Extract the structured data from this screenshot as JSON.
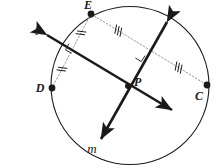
{
  "figure": {
    "background_color": "#ffffff",
    "stroke_color": "#1a1a1a",
    "dotted_color": "#8a8a8a",
    "width": 217,
    "height": 168
  },
  "circle": {
    "name": "circle",
    "cx": 130,
    "cy": 85.5,
    "r": 79,
    "stroke_width": 1.1
  },
  "points": [
    {
      "id": "E",
      "label": "E",
      "x": 91,
      "y": 14,
      "label_x": 88,
      "label_y": 9,
      "dot_r": 3.4
    },
    {
      "id": "D",
      "label": "D",
      "x": 52,
      "y": 88,
      "label_x": 40,
      "label_y": 92,
      "dot_r": 3.4
    },
    {
      "id": "C",
      "label": "C",
      "x": 207,
      "y": 85,
      "label_x": 199,
      "label_y": 100,
      "dot_r": 3.4
    },
    {
      "id": "P",
      "label": "P",
      "x": 128,
      "y": 86,
      "label_x": 134,
      "label_y": 86,
      "dot_r": 3.0
    }
  ],
  "lines": [
    {
      "id": "ell",
      "label": "ℓ",
      "label_x": 37,
      "label_y": 35,
      "x1": 47,
      "y1": 35,
      "x2": 172,
      "y2": 110,
      "stroke_width": 2.6,
      "arrow_start": true,
      "arrow_end": true
    },
    {
      "id": "m",
      "label": "m",
      "label_x": 92,
      "label_y": 153,
      "x1": 167,
      "y1": 22,
      "x2": 101,
      "y2": 139,
      "stroke_width": 2.6,
      "arrow_start": true,
      "arrow_end": true
    }
  ],
  "chords": [
    {
      "id": "chord-EC",
      "from": "E",
      "to": "C",
      "x1": 91,
      "y1": 14,
      "x2": 207,
      "y2": 85,
      "style": "dotted",
      "tick_count": 3,
      "ticks": [
        {
          "t": 0.235,
          "count": 3
        },
        {
          "t": 0.755,
          "count": 3
        }
      ],
      "right_angle_at": {
        "x": 139,
        "y": 52
      }
    },
    {
      "id": "chord-ED",
      "from": "E",
      "to": "D",
      "x1": 91,
      "y1": 14,
      "x2": 52,
      "y2": 88,
      "style": "dotted",
      "tick_count": 2,
      "ticks": [
        {
          "t": 0.255,
          "count": 2
        },
        {
          "t": 0.745,
          "count": 2
        }
      ],
      "right_angle_at": {
        "x": 75,
        "y": 47
      }
    }
  ],
  "markings": {
    "tick_label": "congruence-tick",
    "right_angle_label": "right-angle-marker",
    "right_angle_size": 7,
    "tick_length": 8,
    "tick_spacing": 3
  }
}
